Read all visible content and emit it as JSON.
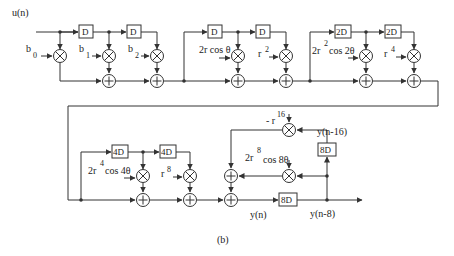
{
  "figure": {
    "caption": "(b)",
    "input_label": "u(n)",
    "row1": {
      "delays": [
        "D",
        "D",
        "D",
        "D",
        "2D",
        "2D"
      ],
      "coefficients": [
        "b",
        "b",
        "b",
        "2r cos θ",
        "r",
        "2r",
        "cos 2θ",
        "r"
      ],
      "coef_b0": {
        "base": "b",
        "sub": "0"
      },
      "coef_b1": {
        "base": "b",
        "sub": "1"
      },
      "coef_b2": {
        "base": "b",
        "sub": "2"
      },
      "coef_2rcos": {
        "text": "2r cos θ"
      },
      "coef_r2": {
        "base": "r",
        "sup": "2"
      },
      "coef_2r2cos": {
        "pre": "2r",
        "sup": "2",
        "post": "cos 2θ"
      },
      "coef_r4": {
        "base": "r",
        "sup": "4"
      }
    },
    "row2": {
      "delays": [
        "4D",
        "4D",
        "8D",
        "8D"
      ],
      "coef_2r4cos": {
        "pre": "2r",
        "sup": "4",
        "post": "cos 4θ"
      },
      "coef_r8": {
        "base": "r",
        "sup": "8"
      },
      "coef_neg_r16": {
        "pre": "- r",
        "sup": "16"
      },
      "coef_2r8cos": {
        "pre": "2r",
        "sup": "8",
        "post": "cos 8θ"
      },
      "signal_yn": "y(n)",
      "signal_yn8": "y(n-8)",
      "signal_yn16": "y(n-16)"
    },
    "symbols": {
      "multiplier": "⊗",
      "adder": "⊕"
    }
  }
}
